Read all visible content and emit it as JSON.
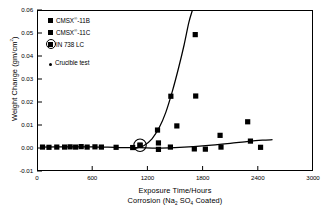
{
  "chart_data": {
    "type": "scatter",
    "title": "",
    "xlabel": "Exposure Time/Hours",
    "xlabel2": "Corrosion (Na2 SO4 Coated)",
    "ylabel": "Weight Change (gm/cm2)",
    "xlim": [
      0,
      3000
    ],
    "ylim": [
      -0.01,
      0.06
    ],
    "xticks": [
      0,
      600,
      1200,
      1800,
      2400,
      3000
    ],
    "yticks": [
      -0.01,
      0.0,
      0.01,
      0.02,
      0.03,
      0.04,
      0.05,
      0.06
    ],
    "ytick_labels": [
      "-0.01",
      "0.00",
      "0.01",
      "0.02",
      "0.03",
      "0.04",
      "0.05",
      "0.06"
    ],
    "xtick_labels": [
      "0",
      "600",
      "1200",
      "1800",
      "2400",
      "3000"
    ],
    "grid": false,
    "legend_position": "top-left",
    "series": [
      {
        "name": "CMSX-11B",
        "marker": "square",
        "points": [
          [
            60,
            0.0004
          ],
          [
            130,
            0.0003
          ],
          [
            215,
            0.0004
          ],
          [
            300,
            0.0004
          ],
          [
            360,
            0.0005
          ],
          [
            420,
            0.0004
          ],
          [
            480,
            0.0006
          ],
          [
            545,
            0.0004
          ],
          [
            630,
            0.0005
          ],
          [
            700,
            0.0004
          ],
          [
            860,
            0.0003
          ],
          [
            1040,
            0.0002
          ],
          [
            1120,
            0.0012
          ],
          [
            1310,
            0.0078
          ],
          [
            1320,
            0.0022
          ],
          [
            1320,
            -0.0006
          ],
          [
            1455,
            0.0225
          ],
          [
            1520,
            0.0096
          ],
          [
            1720,
            0.0493
          ],
          [
            1725,
            0.0226
          ]
        ]
      },
      {
        "name": "CMSX-11C",
        "marker": "square",
        "points": [
          [
            1450,
            0.0004
          ],
          [
            1710,
            -0.0004
          ],
          [
            1830,
            -0.0005
          ],
          [
            1990,
            0.0055
          ],
          [
            2000,
            0.0004
          ],
          [
            2290,
            0.0114
          ],
          [
            2320,
            0.003
          ],
          [
            2430,
            0.0003
          ]
        ]
      },
      {
        "name": "IN 738 LC",
        "marker": "square-circled",
        "points": [
          [
            1120,
            0.0012
          ]
        ]
      }
    ],
    "curves": [
      {
        "name": "steep-rise-curve",
        "points": [
          [
            1060,
            -0.0003
          ],
          [
            1160,
            0.001
          ],
          [
            1250,
            0.004
          ],
          [
            1330,
            0.009
          ],
          [
            1400,
            0.0155
          ],
          [
            1470,
            0.0245
          ],
          [
            1540,
            0.035
          ],
          [
            1600,
            0.045
          ],
          [
            1650,
            0.0545
          ],
          [
            1690,
            0.06
          ]
        ]
      },
      {
        "name": "flat-baseline-curve",
        "points": [
          [
            40,
            0.0004
          ],
          [
            300,
            0.0005
          ],
          [
            600,
            0.0005
          ],
          [
            900,
            0.0002
          ],
          [
            1100,
            0.0002
          ],
          [
            1300,
            0.0
          ],
          [
            1500,
            0.0002
          ],
          [
            1700,
            0.0006
          ],
          [
            1900,
            0.0012
          ],
          [
            2100,
            0.002
          ],
          [
            2300,
            0.0029
          ],
          [
            2450,
            0.0034
          ],
          [
            2560,
            0.0036
          ]
        ]
      }
    ]
  },
  "legend": {
    "items": [
      {
        "label_pre": "CMSX",
        "label_sup": "®",
        "label_post": "-11B",
        "marker": "square"
      },
      {
        "label_pre": "CMSX",
        "label_sup": "®",
        "label_post": "-11C",
        "marker": "square"
      },
      {
        "label_pre": "IN 738 LC",
        "label_sup": "",
        "label_post": "",
        "marker": "square-circled"
      },
      {
        "label_pre": "Crucible test",
        "label_sup": "",
        "label_post": "",
        "marker": "dot"
      }
    ]
  },
  "axis_titles": {
    "x_line1": "Exposure Time/Hours",
    "x_line2_pre": "Corrosion (Na",
    "x_line2_sub1": "2",
    "x_line2_mid": " SO",
    "x_line2_sub2": "4",
    "x_line2_post": " Coated)",
    "y_pre": "Weight Change (gm/cm",
    "y_sup": "2",
    "y_post": ")"
  }
}
